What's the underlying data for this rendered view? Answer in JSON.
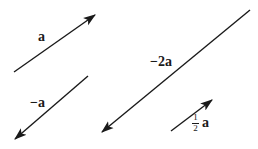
{
  "figure": {
    "background_color": "#ffffff",
    "stroke_color": "#1a1a1a",
    "width": 258,
    "height": 149
  },
  "vectors": [
    {
      "id": "a",
      "label": "a",
      "scalar": 1,
      "direction": "up-right",
      "x1": 14,
      "y1": 72,
      "x2": 95,
      "y2": 15,
      "arrow_at": "end",
      "label_x": 38,
      "label_y": 30
    },
    {
      "id": "neg-a",
      "label": "−a",
      "scalar": -1,
      "direction": "down-left",
      "x1": 88,
      "y1": 76,
      "x2": 14,
      "y2": 140,
      "arrow_at": "end",
      "label_x": 30,
      "label_y": 96
    },
    {
      "id": "neg-2a",
      "label": "−2a",
      "scalar": -2,
      "direction": "down-left",
      "x1": 250,
      "y1": 10,
      "x2": 101,
      "y2": 133,
      "arrow_at": "end",
      "label_x": 150,
      "label_y": 55
    },
    {
      "id": "half-a",
      "label_numerator": "1",
      "label_denominator": "2",
      "label_vector": "a",
      "scalar": 0.5,
      "direction": "up-right",
      "x1": 171,
      "y1": 131,
      "x2": 213,
      "y2": 100,
      "arrow_at": "end",
      "label_x": 192,
      "label_y": 113
    }
  ]
}
